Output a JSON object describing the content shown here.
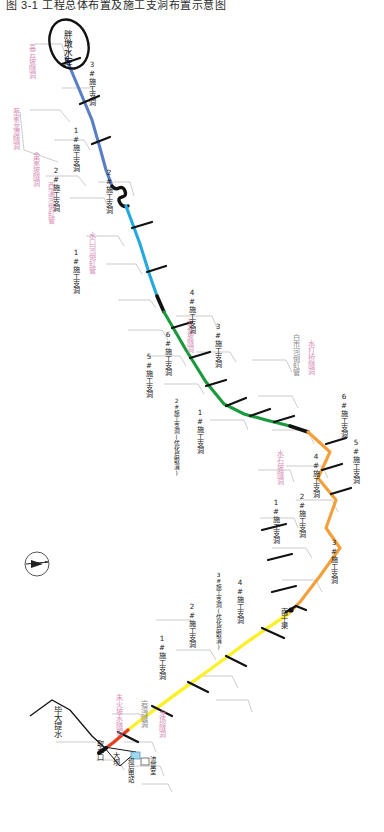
{
  "document": {
    "header_title": "图 3-1  工程总体布置及施工支洞布置示意图",
    "orientation_note": "图件方向旋转 90°（文字竖排）"
  },
  "compass": {
    "name": "north-arrow",
    "label": "N"
  },
  "reservoir": {
    "name": "胖墩水库",
    "shape": "ellipse"
  },
  "endpoints": {
    "intake_source": "毕大提水",
    "intake": "取水口",
    "dam": "大坝",
    "powerstation": "坝后电站",
    "flowmeter_room": "流量室",
    "south_canal": "南干渠"
  },
  "structures": [
    {
      "id": "s1",
      "label": "高云坡隧洞",
      "color": "pink"
    },
    {
      "id": "s2",
      "label": "蔡家龙潭隧洞",
      "color": "pink"
    },
    {
      "id": "s3",
      "label": "金家坡隧洞",
      "color": "pink"
    },
    {
      "id": "s4",
      "label": "西溪河倒虹管",
      "color": "pink"
    },
    {
      "id": "s5",
      "label": "水口河倒虹管",
      "color": "pink"
    },
    {
      "id": "s6",
      "label": "长石坡隧洞",
      "color": "pink"
    },
    {
      "id": "s7",
      "label": "白市河倒虹管",
      "color": "gray"
    },
    {
      "id": "s8",
      "label": "水打桥隧洞",
      "color": "pink"
    },
    {
      "id": "s9",
      "label": "水石坡隧洞",
      "color": "pink"
    },
    {
      "id": "s10",
      "label": "岩湾隧洞",
      "color": "gray"
    },
    {
      "id": "s11",
      "label": "朱火坡水隧洞",
      "color": "pink"
    },
    {
      "id": "s12",
      "label": "龙场隧洞",
      "color": "pink"
    }
  ],
  "segments": [
    {
      "id": "seg-blue",
      "name": "blue-segment",
      "color": "#5b7fc7",
      "branch_tunnels": [
        "1#施工支洞",
        "2#施工支洞",
        "3#施工支洞"
      ]
    },
    {
      "id": "seg-cyan",
      "name": "cyan-segment",
      "color": "#23a8e0",
      "branch_tunnels": [
        "1#施工支洞",
        "2#施工支洞"
      ]
    },
    {
      "id": "seg-green",
      "name": "green-segment",
      "color": "#1a9a3c",
      "branch_tunnels": [
        "1#施工支洞",
        "2#施工支洞(优化后取消)",
        "3#施工支洞",
        "4#施工支洞",
        "5#施工支洞",
        "6#施工支洞"
      ]
    },
    {
      "id": "seg-orange",
      "name": "orange-segment",
      "color": "#f4a03a",
      "branch_tunnels": [
        "1#施工支洞",
        "2#施工支洞",
        "3#施工支洞",
        "4#施工支洞",
        "5#施工支洞",
        "6#施工支洞"
      ]
    },
    {
      "id": "seg-yellow",
      "name": "yellow-segment",
      "color": "#fbf02a",
      "branch_tunnels": [
        "1#施工支洞",
        "2#施工支洞",
        "3#施工支洞(优化后取消)",
        "4#施工支洞"
      ]
    },
    {
      "id": "seg-red",
      "name": "red-segment",
      "color": "#e8401f",
      "branch_tunnels": []
    }
  ],
  "labels": {
    "blue_1": "1#施工支洞",
    "blue_2": "2#施工支洞",
    "blue_3": "3#施工支洞",
    "cyan_1": "1#施工支洞",
    "cyan_2": "2#施工支洞",
    "green_1": "1#施工支洞",
    "green_2": "2#施工支洞(优化后取消)",
    "green_3": "3#施工支洞",
    "green_4": "4#施工支洞",
    "green_5": "5#施工支洞",
    "green_6": "6#施工支洞",
    "orange_1": "1#施工支洞",
    "orange_2": "2#施工支洞",
    "orange_3": "3#施工支洞",
    "orange_4": "4#施工支洞",
    "orange_5": "5#施工支洞",
    "orange_6": "6#施工支洞",
    "yellow_1": "1#施工支洞",
    "yellow_2": "2#施工支洞",
    "yellow_3": "3#施工支洞(优化后取消)",
    "yellow_4": "4#施工支洞"
  },
  "colors": {
    "blue": "#5b7fc7",
    "cyan": "#23a8e0",
    "green": "#1a9a3c",
    "orange": "#f4a03a",
    "yellow": "#fbf02a",
    "red": "#e8401f",
    "black": "#111111",
    "pink_text": "#d98fb8",
    "gray_text": "#8b8b8b",
    "leader": "#9a9a9a"
  }
}
